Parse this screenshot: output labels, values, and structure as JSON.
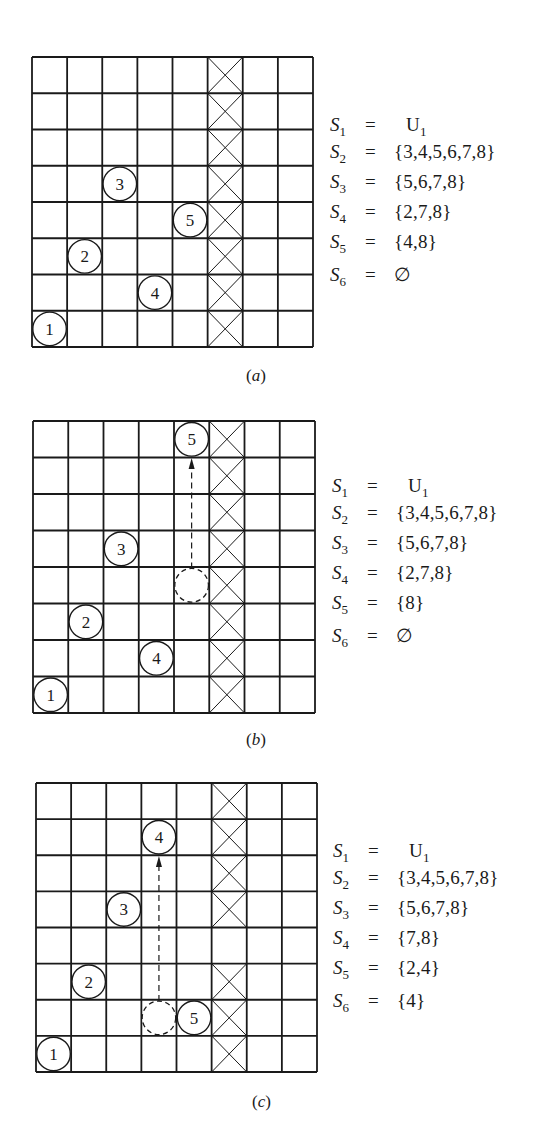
{
  "figure": {
    "grid_size": 8,
    "colors": {
      "line": "#1a1a1a",
      "background": "#ffffff"
    },
    "panels": [
      {
        "id": "a",
        "caption": "a",
        "board": {
          "left": 32,
          "top": 57,
          "width": 281,
          "height": 290,
          "crossed_cells": [
            [
              0,
              5
            ],
            [
              1,
              5
            ],
            [
              2,
              5
            ],
            [
              3,
              5
            ],
            [
              4,
              5
            ],
            [
              5,
              5
            ],
            [
              6,
              5
            ],
            [
              7,
              5
            ]
          ],
          "queens": [
            {
              "label": "1",
              "row": 7,
              "col": 0
            },
            {
              "label": "2",
              "row": 5,
              "col": 1
            },
            {
              "label": "3",
              "row": 3,
              "col": 2
            },
            {
              "label": "4",
              "row": 6,
              "col": 3
            },
            {
              "label": "5",
              "row": 4,
              "col": 4
            }
          ],
          "ghosts": [],
          "arrows": []
        },
        "sets": [
          {
            "name": "S",
            "sub": "1",
            "value": "U",
            "value_sub": "1"
          },
          {
            "name": "S",
            "sub": "2",
            "value": "{3,4,5,6,7,8}"
          },
          {
            "name": "S",
            "sub": "3",
            "value": "{5,6,7,8}"
          },
          {
            "name": "S",
            "sub": "4",
            "value": "{2,7,8}"
          },
          {
            "name": "S",
            "sub": "5",
            "value": "{4,8}"
          },
          {
            "name": "S",
            "sub": "6",
            "value": "∅"
          }
        ],
        "sets_pos": {
          "left": 330,
          "top": 115
        },
        "caption_pos": {
          "left": 246,
          "top": 366
        }
      },
      {
        "id": "b",
        "caption": "b",
        "board": {
          "left": 33,
          "top": 421,
          "width": 282,
          "height": 292,
          "crossed_cells": [
            [
              0,
              5
            ],
            [
              1,
              5
            ],
            [
              2,
              5
            ],
            [
              3,
              5
            ],
            [
              4,
              5
            ],
            [
              5,
              5
            ],
            [
              6,
              5
            ],
            [
              7,
              5
            ]
          ],
          "queens": [
            {
              "label": "1",
              "row": 7,
              "col": 0
            },
            {
              "label": "2",
              "row": 5,
              "col": 1
            },
            {
              "label": "3",
              "row": 3,
              "col": 2
            },
            {
              "label": "4",
              "row": 6,
              "col": 3
            },
            {
              "label": "5",
              "row": 0,
              "col": 4
            }
          ],
          "ghosts": [
            {
              "row": 4,
              "col": 4
            }
          ],
          "arrows": [
            {
              "from_row": 4,
              "to_row": 0,
              "col": 4
            }
          ]
        },
        "sets": [
          {
            "name": "S",
            "sub": "1",
            "value": "U",
            "value_sub": "1"
          },
          {
            "name": "S",
            "sub": "2",
            "value": "{3,4,5,6,7,8}"
          },
          {
            "name": "S",
            "sub": "3",
            "value": "{5,6,7,8}"
          },
          {
            "name": "S",
            "sub": "4",
            "value": "{2,7,8}"
          },
          {
            "name": "S",
            "sub": "5",
            "value": "{8}"
          },
          {
            "name": "S",
            "sub": "6",
            "value": "∅"
          }
        ],
        "sets_pos": {
          "left": 332,
          "top": 476
        },
        "caption_pos": {
          "left": 246,
          "top": 730
        }
      },
      {
        "id": "c",
        "caption": "c",
        "board": {
          "left": 36,
          "top": 783,
          "width": 281,
          "height": 289,
          "crossed_cells": [
            [
              0,
              5
            ],
            [
              1,
              5
            ],
            [
              2,
              5
            ],
            [
              3,
              5
            ],
            [
              5,
              5
            ],
            [
              6,
              5
            ],
            [
              7,
              5
            ]
          ],
          "queens": [
            {
              "label": "1",
              "row": 7,
              "col": 0
            },
            {
              "label": "2",
              "row": 5,
              "col": 1
            },
            {
              "label": "3",
              "row": 3,
              "col": 2
            },
            {
              "label": "4",
              "row": 1,
              "col": 3
            },
            {
              "label": "5",
              "row": 6,
              "col": 4
            }
          ],
          "ghosts": [
            {
              "row": 6,
              "col": 3
            }
          ],
          "arrows": [
            {
              "from_row": 6,
              "to_row": 1,
              "col": 3
            }
          ]
        },
        "sets": [
          {
            "name": "S",
            "sub": "1",
            "value": "U",
            "value_sub": "1"
          },
          {
            "name": "S",
            "sub": "2",
            "value": "{3,4,5,6,7,8}"
          },
          {
            "name": "S",
            "sub": "3",
            "value": "{5,6,7,8}"
          },
          {
            "name": "S",
            "sub": "4",
            "value": "{7,8}"
          },
          {
            "name": "S",
            "sub": "5",
            "value": "{2,4}"
          },
          {
            "name": "S",
            "sub": "6",
            "value": "{4}"
          }
        ],
        "sets_pos": {
          "left": 333,
          "top": 841
        },
        "caption_pos": {
          "left": 252,
          "top": 1092
        }
      }
    ]
  }
}
